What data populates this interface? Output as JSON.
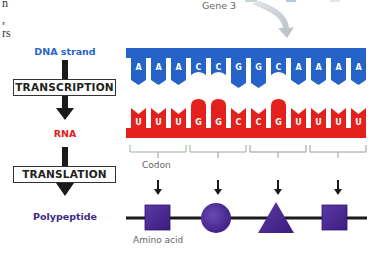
{
  "fragments": {
    "text_lines": [
      "n",
      ",",
      "rs"
    ]
  },
  "gene_label": "Gene 3",
  "left_column": {
    "dna_label": "DNA strand",
    "transcription_label": "TRANSCRIPTION",
    "rna_label": "RNA",
    "translation_label": "TRANSLATION",
    "polypeptide_label": "Polypeptide"
  },
  "dna_strand": {
    "bases": [
      "A",
      "A",
      "A",
      "C",
      "C",
      "G",
      "G",
      "C",
      "A",
      "A",
      "A",
      "A"
    ],
    "color": "#2563c9"
  },
  "rna_strand": {
    "bases": [
      "U",
      "U",
      "U",
      "G",
      "G",
      "C",
      "C",
      "G",
      "U",
      "U",
      "U",
      "U"
    ],
    "color": "#e3201b"
  },
  "codons": {
    "label": "Codon",
    "count": 4
  },
  "polypeptide": {
    "amino_acids": [
      "square",
      "circle",
      "triangle",
      "square"
    ],
    "label": "Amino acid",
    "color": "#4a2a8f"
  },
  "colors": {
    "dna_blue": "#2563c9",
    "rna_red": "#e3201b",
    "protein_purple": "#4a2a8f",
    "polypeptide_label": "#3d2a8a"
  }
}
